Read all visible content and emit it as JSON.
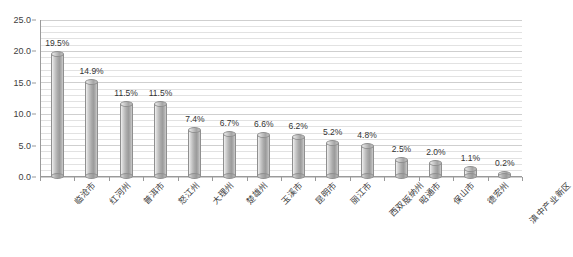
{
  "chart_data": {
    "type": "bar",
    "title": "",
    "subtitle": "",
    "xlabel": "",
    "ylabel": "",
    "ylim": [
      0.0,
      25.0
    ],
    "y_ticks": [
      "0.0",
      "5.0",
      "10.0",
      "15.0",
      "20.0",
      "25.0"
    ],
    "y_tick_values": [
      0.0,
      5.0,
      10.0,
      15.0,
      20.0,
      25.0
    ],
    "y_minor_step": 1.0,
    "grid": true,
    "grid_axis": "y",
    "legend": false,
    "legend_position": "none",
    "data_labels": true,
    "categories": [
      "临沧市",
      "红河州",
      "普洱市",
      "怒江州",
      "大理州",
      "楚雄州",
      "玉溪市",
      "昆明市",
      "丽江市",
      "西双版纳州",
      "昭通市",
      "保山市",
      "德宏州",
      "滇中产业新区"
    ],
    "values": [
      19.5,
      14.9,
      11.5,
      11.5,
      7.4,
      6.7,
      6.6,
      6.2,
      5.2,
      4.8,
      2.5,
      2.0,
      1.1,
      0.2
    ],
    "value_labels": [
      "19.5%",
      "14.9%",
      "11.5%",
      "11.5%",
      "7.4%",
      "6.7%",
      "6.6%",
      "6.2%",
      "5.2%",
      "4.8%",
      "2.5%",
      "2.0%",
      "1.1%",
      "0.2%"
    ],
    "series": [
      {
        "name": "",
        "values": [
          19.5,
          14.9,
          11.5,
          11.5,
          7.4,
          6.7,
          6.6,
          6.2,
          5.2,
          4.8,
          2.5,
          2.0,
          1.1,
          0.2
        ]
      }
    ],
    "bar_style": "cylinder-3d",
    "bar_color": "#a8a8a8",
    "bar_edge_color": "#8f8f8f",
    "gridline_color": "#e2e2e2",
    "axis_color": "#9a9a9a",
    "text_color": "#3a3a3a"
  },
  "caption": {
    "text": ""
  }
}
